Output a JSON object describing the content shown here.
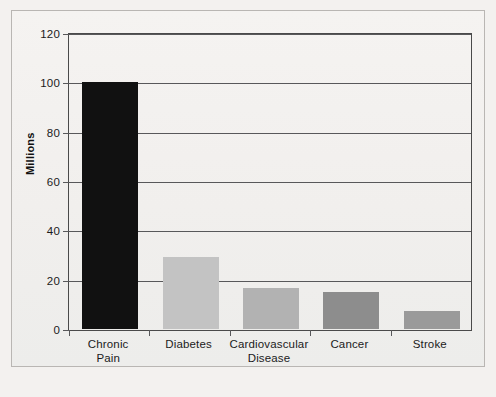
{
  "chart_data": {
    "type": "bar",
    "title": "",
    "subtitle": "",
    "xlabel": "",
    "ylabel": "Millions",
    "categories": [
      "Chronic Pain",
      "Diabetes",
      "Cardiovascular Disease",
      "Cancer",
      "Stroke"
    ],
    "category_lines": [
      [
        "Chronic",
        "Pain"
      ],
      [
        "Diabetes"
      ],
      [
        "Cardiovascular",
        "Disease"
      ],
      [
        "Cancer"
      ],
      [
        "Stroke"
      ]
    ],
    "values": [
      100,
      29,
      16.5,
      15,
      7.5
    ],
    "bar_colors": [
      "#111111",
      "#c3c3c3",
      "#b2b2b2",
      "#8d8d8d",
      "#9a9a9a"
    ],
    "ylim": [
      0,
      120
    ],
    "yticks": [
      0,
      20,
      40,
      60,
      80,
      100,
      120
    ],
    "ytick_labels": [
      "0",
      "20",
      "40",
      "60",
      "80",
      "100",
      "120"
    ],
    "grid": true,
    "grid_axis": "y",
    "legend": false,
    "legend_position": "none"
  },
  "figure": {
    "background_color": "#f3f1ef",
    "border_color": "#b9b6b3",
    "axis_color": "#58585a",
    "text_color": "#1b1b1b"
  }
}
